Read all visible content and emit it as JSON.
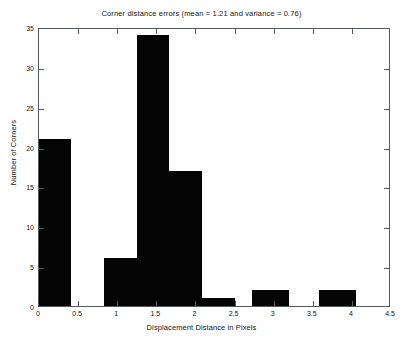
{
  "chart_data": {
    "type": "bar",
    "title": "Corner distance errors (mean = 1.21 and variance = 0.76)",
    "xlabel": "Displacement Distance in Pixels",
    "ylabel": "Number of Corners",
    "xlim": [
      0,
      4.5
    ],
    "ylim": [
      0,
      35
    ],
    "xticks": [
      0,
      0.5,
      1,
      1.5,
      2,
      2.5,
      3,
      3.5,
      4,
      4.5
    ],
    "xtick_labels": [
      "0",
      "0.5",
      "1",
      "1.5",
      "2",
      "2.5",
      "3",
      "3.5",
      "4",
      "4.5"
    ],
    "yticks": [
      0,
      5,
      10,
      15,
      20,
      25,
      30,
      35
    ],
    "ytick_labels": [
      "0",
      "5",
      "10",
      "15",
      "20",
      "25",
      "30",
      "35"
    ],
    "grid": false,
    "legend": "none",
    "bar_color": "#040404",
    "bins": [
      {
        "x_start": 0.0,
        "x_end": 0.41,
        "value": 21
      },
      {
        "x_start": 0.83,
        "x_end": 1.25,
        "value": 6
      },
      {
        "x_start": 1.25,
        "x_end": 1.66,
        "value": 34
      },
      {
        "x_start": 1.66,
        "x_end": 2.08,
        "value": 17
      },
      {
        "x_start": 2.08,
        "x_end": 2.5,
        "value": 1
      },
      {
        "x_start": 2.72,
        "x_end": 3.2,
        "value": 2
      },
      {
        "x_start": 3.58,
        "x_end": 4.05,
        "value": 2
      }
    ],
    "categories": [
      "0-0.41",
      "0.83-1.25",
      "1.25-1.66",
      "1.66-2.08",
      "2.08-2.5",
      "2.72-3.2",
      "3.58-4.05"
    ],
    "values": [
      21,
      6,
      34,
      17,
      1,
      2,
      2
    ],
    "statistics": {
      "mean": 1.21,
      "variance": 0.76
    }
  }
}
